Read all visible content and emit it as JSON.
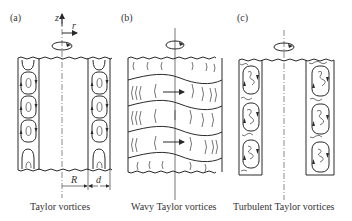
{
  "figure": {
    "panels": [
      {
        "tag": "(a)",
        "caption": "Taylor vortices",
        "axis_z": "z",
        "axis_r": "r",
        "dim_R": "R",
        "dim_d": "d"
      },
      {
        "tag": "(b)",
        "caption": "Wavy Taylor vortices"
      },
      {
        "tag": "(c)",
        "caption": "Turbulent Taylor vortices"
      }
    ],
    "colors": {
      "ink": "#2a2a2a",
      "background": "#ffffff"
    }
  }
}
